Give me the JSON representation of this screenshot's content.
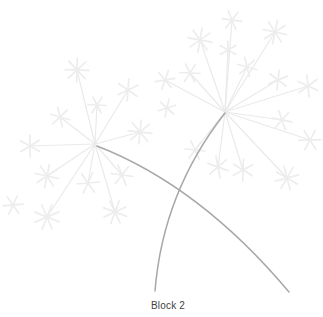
{
  "window": {
    "width": 323,
    "height": 317,
    "background": "#ffffff"
  },
  "caption": {
    "text": "Block 2",
    "color": "#3f3f3f"
  },
  "illustration": {
    "description": "two pale dandelion seed heads with crossing gray stems",
    "colors": {
      "stem": "#a8a8a8",
      "spoke": "#eaeaea",
      "star": "#ededed"
    },
    "stem_width": 1.5,
    "spoke_width": 1.2,
    "star_width": 1.7,
    "stems": [
      {
        "name": "left-stem",
        "path": "M 97 146 Q 200 186 289 292"
      },
      {
        "name": "right-stem",
        "path": "M 225 113 Q 163 192 155 291"
      }
    ],
    "heads": [
      {
        "name": "left-dandelion-head",
        "center": {
          "x": 95,
          "y": 144
        },
        "tips": [
          [
            77,
            70,
            12
          ],
          [
            128,
            90,
            11
          ],
          [
            140,
            132,
            12
          ],
          [
            122,
            175,
            11
          ],
          [
            88,
            183,
            11
          ],
          [
            47,
            176,
            12
          ],
          [
            30,
            146,
            11
          ],
          [
            60,
            117,
            10
          ],
          [
            97,
            105,
            9
          ],
          [
            115,
            212,
            12
          ],
          [
            47,
            217,
            13
          ]
        ]
      },
      {
        "name": "right-dandelion-head",
        "center": {
          "x": 225,
          "y": 112
        },
        "tips": [
          [
            232,
            20,
            10
          ],
          [
            200,
            40,
            12
          ],
          [
            275,
            32,
            12
          ],
          [
            228,
            50,
            9
          ],
          [
            247,
            67,
            10
          ],
          [
            190,
            73,
            10
          ],
          [
            165,
            80,
            10
          ],
          [
            278,
            80,
            10
          ],
          [
            308,
            86,
            11
          ],
          [
            282,
            120,
            10
          ],
          [
            310,
            140,
            11
          ],
          [
            287,
            178,
            12
          ],
          [
            243,
            170,
            11
          ],
          [
            218,
            167,
            11
          ],
          [
            195,
            150,
            10
          ]
        ]
      }
    ],
    "loose_stars": [
      [
        13,
        205,
        10
      ],
      [
        167,
        108,
        9
      ]
    ]
  }
}
